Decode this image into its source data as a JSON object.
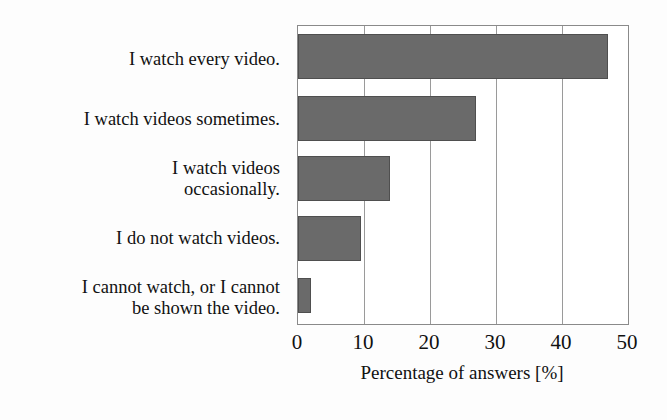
{
  "chart_data": {
    "type": "bar",
    "orientation": "horizontal",
    "title": "",
    "subtitle": "",
    "categories": [
      "I watch every video.",
      "I watch videos sometimes.",
      "I watch videos\noccasionally.",
      "I do not watch videos.",
      "I cannot watch, or I cannot\nbe shown the video."
    ],
    "values": [
      47,
      27,
      14,
      9.5,
      2
    ],
    "xlabel": "Percentage of answers [%]",
    "ylabel": "",
    "xlim": [
      0,
      50
    ],
    "xticks": [
      0,
      10,
      20,
      30,
      40,
      50
    ],
    "xticklabels": [
      "0",
      "10",
      "20",
      "30",
      "40",
      "50"
    ],
    "grid": "vertical",
    "legend": "none",
    "bar_color": "#6a6a6a",
    "frame_color": "#8a8a8a",
    "gridline_color": "#9a9a9a",
    "background_color": "#ffffff"
  }
}
